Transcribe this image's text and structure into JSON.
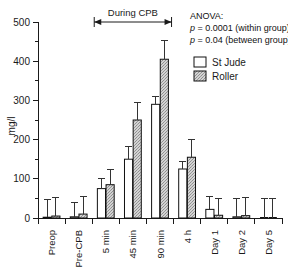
{
  "chart_data": {
    "type": "bar",
    "title": "",
    "xlabel": "",
    "ylabel": "mg/l",
    "ylim": [
      0,
      500
    ],
    "ytick_values": [
      0,
      100,
      200,
      300,
      400,
      500
    ],
    "ytick_labels": [
      "0",
      "100",
      "200",
      "300",
      "400",
      "500"
    ],
    "yminor_values": [
      50,
      150,
      250,
      350,
      450
    ],
    "grid": false,
    "legend_position": "top-right",
    "categories": [
      "Preop",
      "Pre-CPB",
      "5 min",
      "45 min",
      "90 min",
      "4 h",
      "Day 1",
      "Day 2",
      "Day 5"
    ],
    "series": [
      {
        "name": "St Jude",
        "fill": "white",
        "values": [
          2,
          3,
          75,
          150,
          290,
          125,
          22,
          3,
          0
        ],
        "errors_upper": [
          48,
          40,
          100,
          182,
          310,
          145,
          55,
          50,
          50
        ]
      },
      {
        "name": "Roller",
        "fill": "gray-stipple",
        "values": [
          5,
          10,
          85,
          250,
          405,
          155,
          7,
          6,
          0
        ],
        "errors_upper": [
          52,
          55,
          125,
          295,
          452,
          200,
          50,
          52,
          50
        ]
      }
    ],
    "annotations": [
      {
        "name": "during-cpb-span",
        "text": "During CPB",
        "from_category": "5 min",
        "to_category": "90 min"
      }
    ],
    "stats": {
      "heading": "ANOVA:",
      "line1_prefix": "p",
      "line1_body": " = 0.0001 (within group)",
      "line2_prefix": "p",
      "line2_body": " = 0.04 (between group)"
    }
  },
  "legend": {
    "items": [
      {
        "label": "St Jude",
        "swatch": "white"
      },
      {
        "label": "Roller",
        "swatch": "gray-stipple"
      }
    ]
  },
  "colors": {
    "axis": "#1a1a1a",
    "bar_outline": "#111111",
    "roller_fill": "#c9c9c9",
    "stjude_fill": "#ffffff",
    "background": "#ffffff"
  }
}
